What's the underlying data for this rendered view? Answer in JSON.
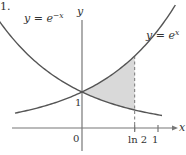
{
  "figure": {
    "problem_number": "1.",
    "labels": {
      "left_curve": "y = e",
      "left_curve_exp": "−x",
      "right_curve": "y = e",
      "right_curve_exp": "x",
      "y_axis": "y",
      "x_axis": "x",
      "y_intercept": "1",
      "origin": "0",
      "tick_ln2": "ln 2",
      "tick_one": "1"
    },
    "colors": {
      "curve": "#555555",
      "axis": "#777777",
      "shade": "#d9d9d9",
      "dash": "#777777"
    },
    "shaded_region": "between y = e^x and y = e^{-x}, from x = 0 to x = ln 2"
  }
}
